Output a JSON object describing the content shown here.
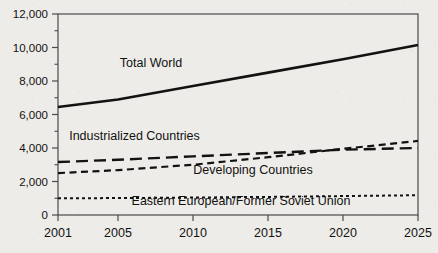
{
  "chart_data": {
    "type": "line",
    "title": "",
    "subtitle": "",
    "xlabel": "",
    "ylabel": "",
    "x": [
      2001,
      2005,
      2010,
      2015,
      2020,
      2025
    ],
    "xlim": [
      2001,
      2025
    ],
    "ylim": [
      0,
      12000
    ],
    "grid": false,
    "legend_position": "inline-annotations",
    "x_ticks": [
      "2001",
      "2005",
      "2010",
      "2015",
      "2020",
      "2025"
    ],
    "y_ticks": [
      "0",
      "2,000",
      "4,000",
      "6,000",
      "8,000",
      "10,000",
      "12,000"
    ],
    "y_tick_values": [
      0,
      2000,
      4000,
      6000,
      8000,
      10000,
      12000
    ],
    "y_minor_tick_values": [
      1000,
      3000,
      5000,
      7000,
      9000,
      11000
    ],
    "series": [
      {
        "name": "Total World",
        "style": "solid",
        "color": "#121212",
        "width": 2.6,
        "label": "Total World",
        "label_x": 2007.2,
        "label_y": 8850,
        "values": [
          6450,
          6900,
          7700,
          8500,
          9300,
          10150
        ]
      },
      {
        "name": "Industrialized Countries",
        "style": "long-dash",
        "color": "#121212",
        "width": 2.4,
        "label": "Industrialized Countries",
        "label_x": 2006.1,
        "label_y": 4450,
        "values": [
          3160,
          3300,
          3500,
          3700,
          3900,
          4000
        ]
      },
      {
        "name": "Developing Countries",
        "style": "short-dash",
        "color": "#121212",
        "width": 2.2,
        "label": "Developing Countries",
        "label_x": 2014.0,
        "label_y": 2450,
        "values": [
          2500,
          2680,
          3000,
          3450,
          3950,
          4420
        ]
      },
      {
        "name": "Eastern European/Former Soviet Union",
        "style": "dotted",
        "color": "#121212",
        "width": 2.0,
        "label": "Eastern European/Former Soviet Union",
        "label_x": 2013.2,
        "label_y": 620,
        "values": [
          1000,
          1010,
          1040,
          1080,
          1130,
          1180
        ]
      }
    ],
    "axis": {
      "frame_color": "#4a4a4a",
      "frame_width": 1.2,
      "tick_color": "#4a4a4a",
      "label_color": "#111111",
      "plot_left": 58,
      "plot_right": 418,
      "plot_top": 14,
      "plot_bottom": 215
    },
    "background_color": "#eeece8"
  }
}
